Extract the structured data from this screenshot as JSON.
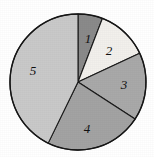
{
  "chart_data": {
    "type": "pie",
    "title": "",
    "subtitle": "",
    "xlabel": "",
    "ylabel": "",
    "grid": false,
    "legend": "none",
    "labels_inside_slices": true,
    "geometry": {
      "center_x": 78,
      "center_y": 82,
      "radius": 68,
      "start_angle_deg": 0,
      "direction": "clockwise",
      "outline_color": "#161616"
    },
    "categories": [
      "1",
      "2",
      "3",
      "4",
      "5"
    ],
    "values": [
      5.8,
      12.2,
      16.1,
      23.1,
      42.8
    ],
    "slices": [
      {
        "label": "1",
        "value": 5.8,
        "start_angle_deg": 0,
        "end_angle_deg": 21,
        "color": "#8a8a8a",
        "label_x": 88,
        "label_y": 40
      },
      {
        "label": "2",
        "value": 12.2,
        "start_angle_deg": 21,
        "end_angle_deg": 65,
        "color": "#f2f0ec",
        "label_x": 109,
        "label_y": 52
      },
      {
        "label": "3",
        "value": 16.1,
        "start_angle_deg": 65,
        "end_angle_deg": 123,
        "color": "#a9a9a9",
        "label_x": 124,
        "label_y": 86
      },
      {
        "label": "4",
        "value": 23.1,
        "start_angle_deg": 123,
        "end_angle_deg": 206,
        "color": "#a3a3a3",
        "label_x": 87,
        "label_y": 130
      },
      {
        "label": "5",
        "value": 42.8,
        "start_angle_deg": 206,
        "end_angle_deg": 360,
        "color": "#c9c9c9",
        "label_x": 33,
        "label_y": 72
      }
    ]
  }
}
